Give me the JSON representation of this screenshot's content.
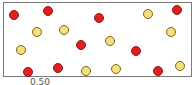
{
  "diagram": {
    "colors": {
      "red": "#e21f1f",
      "yellow": "#f7df7a",
      "frame": "#7a7a7a"
    },
    "circles": [
      {
        "color": "red",
        "x": 14,
        "y": 15
      },
      {
        "color": "red",
        "x": 48,
        "y": 11
      },
      {
        "color": "red",
        "x": 99,
        "y": 18
      },
      {
        "color": "red",
        "x": 177,
        "y": 10
      },
      {
        "color": "red",
        "x": 81,
        "y": 45
      },
      {
        "color": "red",
        "x": 136,
        "y": 51
      },
      {
        "color": "red",
        "x": 28,
        "y": 72
      },
      {
        "color": "red",
        "x": 58,
        "y": 68
      },
      {
        "color": "red",
        "x": 158,
        "y": 71
      },
      {
        "color": "yellow",
        "x": 148,
        "y": 14
      },
      {
        "color": "yellow",
        "x": 37,
        "y": 32
      },
      {
        "color": "yellow",
        "x": 64,
        "y": 30
      },
      {
        "color": "yellow",
        "x": 171,
        "y": 32
      },
      {
        "color": "yellow",
        "x": 110,
        "y": 41
      },
      {
        "color": "yellow",
        "x": 21,
        "y": 50
      },
      {
        "color": "yellow",
        "x": 86,
        "y": 71
      },
      {
        "color": "yellow",
        "x": 116,
        "y": 69
      },
      {
        "color": "yellow",
        "x": 180,
        "y": 66
      }
    ],
    "counts": {
      "red": 9,
      "yellow": 9
    },
    "caption": "0.50"
  }
}
